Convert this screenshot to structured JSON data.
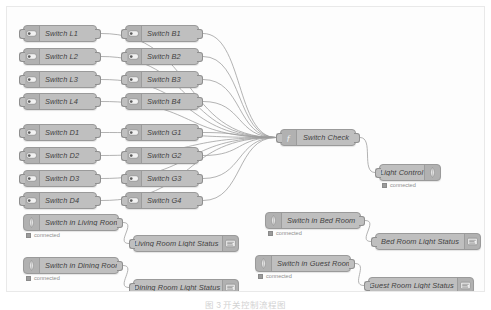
{
  "canvas": {
    "background_color": "#fdfdfd",
    "border_color": "#e9e9e9",
    "node_color": "#bfbfbf",
    "wire_color": "#9b9b9b"
  },
  "caption": {
    "text": "图 3  开关控制流程图"
  },
  "status_label": "connected",
  "nodes": {
    "switch_column_left": [
      {
        "id": "switch-l1",
        "label": "Switch L1",
        "icon": "toggle-switch-icon",
        "x": 16,
        "y": 18
      },
      {
        "id": "switch-l2",
        "label": "Switch L2",
        "icon": "toggle-switch-icon",
        "x": 16,
        "y": 41
      },
      {
        "id": "switch-l3",
        "label": "Switch L3",
        "icon": "toggle-switch-icon",
        "x": 16,
        "y": 64
      },
      {
        "id": "switch-l4",
        "label": "Switch L4",
        "icon": "toggle-switch-icon",
        "x": 16,
        "y": 86
      },
      {
        "id": "switch-d1",
        "label": "Switch D1",
        "icon": "toggle-switch-icon",
        "x": 16,
        "y": 117
      },
      {
        "id": "switch-d2",
        "label": "Switch D2",
        "icon": "toggle-switch-icon",
        "x": 16,
        "y": 140
      },
      {
        "id": "switch-d3",
        "label": "Switch D3",
        "icon": "toggle-switch-icon",
        "x": 16,
        "y": 163
      },
      {
        "id": "switch-d4",
        "label": "Switch D4",
        "icon": "toggle-switch-icon",
        "x": 16,
        "y": 185
      }
    ],
    "switch_column_mid": [
      {
        "id": "switch-b1",
        "label": "Switch B1",
        "icon": "toggle-switch-icon",
        "x": 118,
        "y": 18
      },
      {
        "id": "switch-b2",
        "label": "Switch B2",
        "icon": "toggle-switch-icon",
        "x": 118,
        "y": 41
      },
      {
        "id": "switch-b3",
        "label": "Switch B3",
        "icon": "toggle-switch-icon",
        "x": 118,
        "y": 64
      },
      {
        "id": "switch-b4",
        "label": "Switch B4",
        "icon": "toggle-switch-icon",
        "x": 118,
        "y": 86
      },
      {
        "id": "switch-g1",
        "label": "Switch G1",
        "icon": "toggle-switch-icon",
        "x": 118,
        "y": 117
      },
      {
        "id": "switch-g2",
        "label": "Switch G2",
        "icon": "toggle-switch-icon",
        "x": 118,
        "y": 140
      },
      {
        "id": "switch-g3",
        "label": "Switch G3",
        "icon": "toggle-switch-icon",
        "x": 118,
        "y": 163
      },
      {
        "id": "switch-g4",
        "label": "Switch G4",
        "icon": "toggle-switch-icon",
        "x": 118,
        "y": 185
      }
    ],
    "function_node": {
      "id": "switch-check",
      "label": "Switch Check",
      "icon": "function-icon",
      "x": 273,
      "y": 122
    },
    "output_node": {
      "id": "light-control",
      "label": "Light Control",
      "icon": "mqtt-out-icon",
      "status": "connected",
      "x": 372,
      "y": 157
    },
    "room_flows": [
      {
        "input": {
          "id": "switch-in-living-room",
          "label": "Switch in Living Room",
          "icon": "mqtt-in-icon",
          "status": "connected",
          "x": 16,
          "y": 207
        },
        "output": {
          "id": "living-room-light-status",
          "label": "Living Room Light Status",
          "icon": "debug-icon",
          "x": 126,
          "y": 228
        }
      },
      {
        "input": {
          "id": "switch-in-dining-room",
          "label": "Switch in Dining Room",
          "icon": "mqtt-in-icon",
          "status": "connected",
          "x": 16,
          "y": 250
        },
        "output": {
          "id": "dining-room-light-status",
          "label": "Dining Room Light Status",
          "icon": "debug-icon",
          "x": 126,
          "y": 272
        }
      },
      {
        "input": {
          "id": "switch-in-bed-room",
          "label": "Switch in Bed Room",
          "icon": "mqtt-in-icon",
          "status": "connected",
          "x": 258,
          "y": 205
        },
        "output": {
          "id": "bed-room-light-status",
          "label": "Bed Room Light Status",
          "icon": "debug-icon",
          "x": 368,
          "y": 226
        }
      },
      {
        "input": {
          "id": "switch-in-guest-room",
          "label": "Switch in Guest Room",
          "icon": "mqtt-in-icon",
          "status": "connected",
          "x": 248,
          "y": 248
        },
        "output": {
          "id": "guest-room-light-status",
          "label": "Guest Room Light Status",
          "icon": "debug-icon",
          "x": 361,
          "y": 270
        }
      }
    ]
  }
}
